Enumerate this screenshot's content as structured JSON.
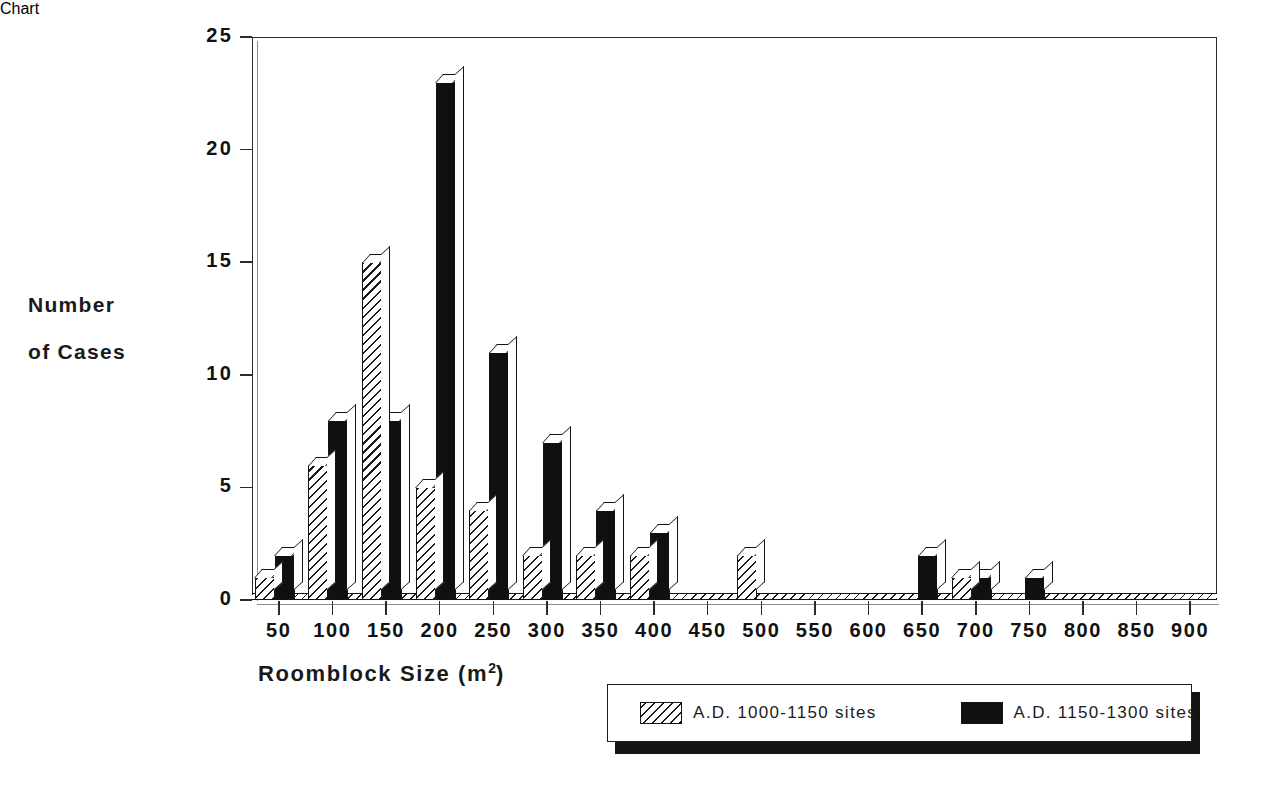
{
  "chart_data": {
    "type": "bar",
    "title": "",
    "xlabel": "Roomblock Size (m2)",
    "xlabel_base": "Roomblock Size (m",
    "xlabel_sup": "2",
    "xlabel_tail": ")",
    "ylabel": "Number of Cases",
    "ylabel_line1": "Number",
    "ylabel_line2": "of Cases",
    "categories": [
      "50",
      "100",
      "150",
      "200",
      "250",
      "300",
      "350",
      "400",
      "450",
      "500",
      "550",
      "600",
      "650",
      "700",
      "750",
      "800",
      "850",
      "900"
    ],
    "series": [
      {
        "name": "A.D. 1000-1150 sites",
        "pattern": "hatched",
        "values": [
          1,
          6,
          15,
          5,
          4,
          2,
          2,
          2,
          0,
          2,
          0,
          0,
          0,
          1,
          0,
          0,
          0,
          0
        ]
      },
      {
        "name": "A.D. 1150-1300 sites",
        "pattern": "solid-black",
        "values": [
          2,
          8,
          8,
          23,
          11,
          7,
          4,
          3,
          0,
          0,
          0,
          0,
          2,
          1,
          1,
          0,
          0,
          0
        ]
      }
    ],
    "yticks": [
      0,
      5,
      10,
      15,
      20,
      25
    ],
    "ylim": [
      0,
      25
    ],
    "grid": "horizontal-dotted",
    "legend_position": "bottom-right",
    "colors": {
      "axis": "#2b2b2b",
      "grid": "#b9b9b9",
      "series1_fill": "#ffffff",
      "series1_hatch": "#1a1a1a",
      "series2_fill": "#101010",
      "background": "#ffffff"
    }
  },
  "legend": {
    "entries": [
      {
        "label": "A.D. 1000-1150 sites",
        "swatch": "hatched-swatch"
      },
      {
        "label": "A.D. 1150-1300 sites",
        "swatch": "solid-black-swatch"
      }
    ]
  }
}
